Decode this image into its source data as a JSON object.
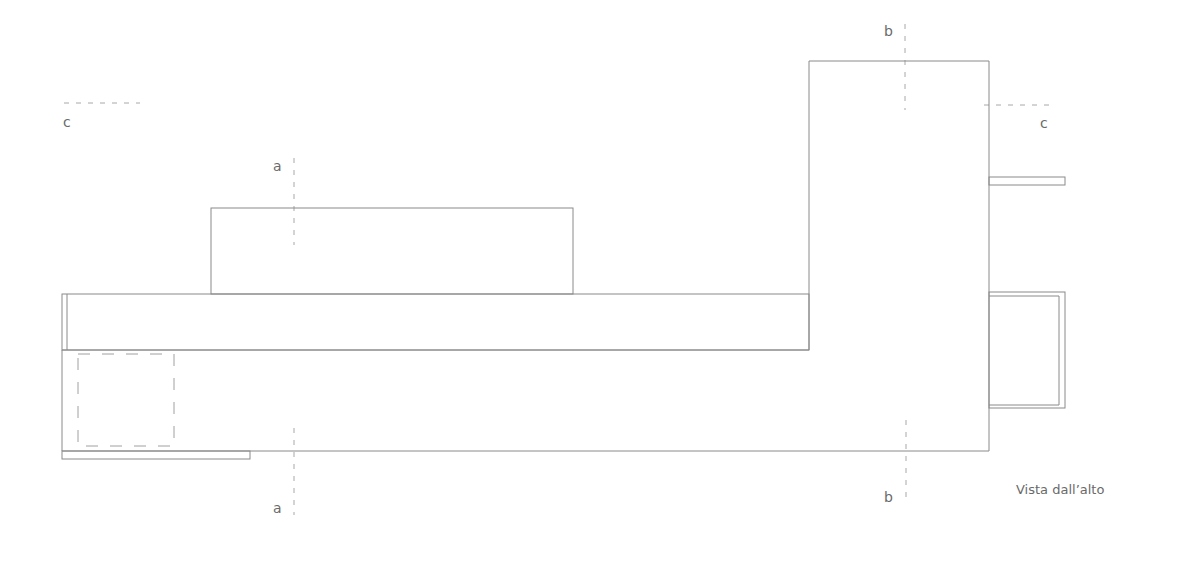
{
  "drawing": {
    "caption": "Vista dall’alto",
    "section_labels": {
      "a_top": "a",
      "a_bottom": "a",
      "b_top": "b",
      "b_bottom": "b",
      "c_left": "c",
      "c_right": "c"
    },
    "colors": {
      "line": "#8a8a8a",
      "section_line": "#a8a8a8",
      "text": "#6a6a6a"
    }
  }
}
